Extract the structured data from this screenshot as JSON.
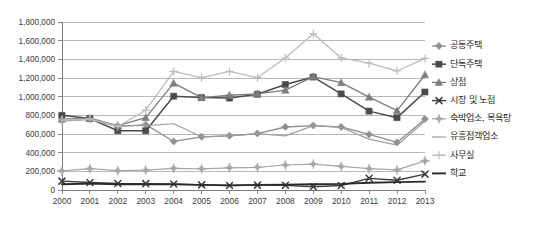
{
  "chart_data": {
    "type": "line",
    "title": "",
    "xlabel": "",
    "ylabel": "",
    "categories": [
      "2000",
      "2001",
      "2002",
      "2003",
      "2004",
      "2005",
      "2006",
      "2007",
      "2008",
      "2009",
      "2010",
      "2011",
      "2012",
      "2013"
    ],
    "ylim": [
      0,
      1800000
    ],
    "ytick_values": [
      0,
      200000,
      400000,
      600000,
      800000,
      1000000,
      1200000,
      1400000,
      1600000,
      1800000
    ],
    "ytick_labels": [
      "0",
      "200,000",
      "400,000",
      "600,000",
      "800,000",
      "1,000,000",
      "1,200,000",
      "1,400,000",
      "1,600,000",
      "1,800,000"
    ],
    "grid": true,
    "legend_position": "right",
    "series": [
      {
        "name": "공동주택",
        "color": "#8f8f8f",
        "marker": "diamond",
        "width": 1.3,
        "values": [
          745000,
          760000,
          680000,
          700000,
          520000,
          570000,
          580000,
          605000,
          675000,
          690000,
          675000,
          595000,
          510000,
          760000
        ]
      },
      {
        "name": "단독주택",
        "color": "#4a4a4a",
        "marker": "square",
        "width": 1.5,
        "values": [
          800000,
          765000,
          635000,
          635000,
          1005000,
          990000,
          985000,
          1025000,
          1130000,
          1210000,
          1030000,
          845000,
          775000,
          1050000
        ]
      },
      {
        "name": "상점",
        "color": "#7d7d7d",
        "marker": "triangle",
        "width": 1.3,
        "values": [
          760000,
          770000,
          690000,
          775000,
          1145000,
          990000,
          1015000,
          1030000,
          1070000,
          1215000,
          1150000,
          995000,
          850000,
          1235000
        ]
      },
      {
        "name": "시장 및 노점",
        "color": "#3c3c3c",
        "marker": "x",
        "width": 1.4,
        "values": [
          95000,
          80000,
          70000,
          68000,
          65000,
          55000,
          48000,
          52000,
          50000,
          35000,
          48000,
          125000,
          105000,
          170000
        ]
      },
      {
        "name": "숙박업소, 목욕탕",
        "color": "#a8a8a8",
        "marker": "plus-diamond",
        "width": 1.2,
        "values": [
          205000,
          228000,
          207000,
          212000,
          232000,
          227000,
          238000,
          243000,
          268000,
          278000,
          253000,
          228000,
          215000,
          312000
        ]
      },
      {
        "name": "유흥접객업소",
        "color": "#9d9d9d",
        "marker": "none",
        "width": 1.2,
        "values": [
          740000,
          755000,
          690000,
          690000,
          710000,
          570000,
          580000,
          605000,
          580000,
          690000,
          670000,
          545000,
          480000,
          740000
        ]
      },
      {
        "name": "사무실",
        "color": "#bcbcbc",
        "marker": "plus",
        "width": 1.3,
        "values": [
          750000,
          760000,
          680000,
          855000,
          1270000,
          1205000,
          1270000,
          1205000,
          1415000,
          1675000,
          1415000,
          1360000,
          1275000,
          1410000
        ]
      },
      {
        "name": "학교",
        "color": "#2a2a2a",
        "marker": "none",
        "width": 1.9,
        "values": [
          62000,
          68000,
          62000,
          60000,
          60000,
          55000,
          50000,
          55000,
          58000,
          62000,
          66000,
          78000,
          84000,
          90000
        ]
      }
    ]
  },
  "axes": {
    "y_axis_name": "value-axis",
    "x_axis_name": "year-axis"
  }
}
